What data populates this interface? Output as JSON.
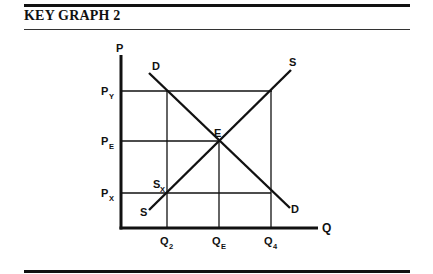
{
  "header": {
    "title": "KEY GRAPH 2"
  },
  "graph": {
    "y_axis_label": "P",
    "x_axis_label": "Q",
    "price_labels": [
      {
        "main": "P",
        "sub": "Y"
      },
      {
        "main": "P",
        "sub": "E"
      },
      {
        "main": "P",
        "sub": "X"
      }
    ],
    "quantity_labels": [
      {
        "main": "Q",
        "sub": "2"
      },
      {
        "main": "Q",
        "sub": "E"
      },
      {
        "main": "Q",
        "sub": "4"
      }
    ],
    "curve_labels": {
      "demand_top": "D",
      "demand_bottom": "D",
      "supply_top": "S",
      "supply_bottom": "S",
      "equilibrium": "E",
      "supply_point": {
        "main": "S",
        "sub": "X"
      }
    }
  }
}
